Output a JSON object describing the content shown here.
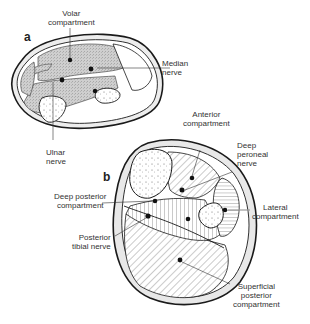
{
  "figure": {
    "panels": [
      {
        "id": "a",
        "label": "a",
        "labels": {
          "volar": [
            "Volar",
            "compartment"
          ],
          "median": [
            "Median",
            "nerve"
          ],
          "ulnar": [
            "Ulnar",
            "nerve"
          ]
        }
      },
      {
        "id": "b",
        "label": "b",
        "labels": {
          "anterior": [
            "Anterior",
            "compartment"
          ],
          "deep_peroneal": [
            "Deep",
            "peroneal",
            "nerve"
          ],
          "deep_posterior": [
            "Deep posterior",
            "compartment"
          ],
          "lateral": [
            "Lateral",
            "compartment"
          ],
          "posterior_tibial": [
            "Posterior",
            "tibial nerve"
          ],
          "superficial_posterior": [
            "Superficial",
            "posterior",
            "compartment"
          ]
        }
      }
    ],
    "colors": {
      "outline": "#1a1a1a",
      "volar_fill": "#c9c9c9",
      "skin_ring": "#e6e6e6",
      "background": "#ffffff"
    }
  }
}
